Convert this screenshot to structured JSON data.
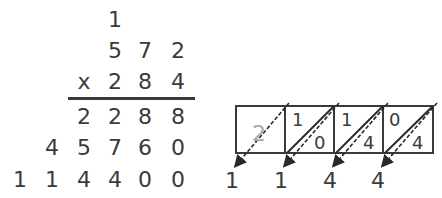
{
  "multiplication": {
    "carry": "1",
    "multiplicand": [
      "5",
      "7",
      "2"
    ],
    "operator": "x",
    "multiplier": [
      "2",
      "8",
      "4"
    ],
    "partial_1": [
      "2",
      "2",
      "8",
      "8"
    ],
    "partial_2": [
      "4",
      "5",
      "7",
      "6",
      "0"
    ],
    "result": [
      "1",
      "1",
      "4",
      "4",
      "0",
      "0"
    ]
  },
  "lattice": {
    "cells": [
      {
        "top": "",
        "bottom": "2",
        "faded": true
      },
      {
        "top": "1",
        "bottom": "0"
      },
      {
        "top": "1",
        "bottom": "4"
      },
      {
        "top": "0",
        "bottom": "4"
      }
    ],
    "output_digits": [
      "1",
      "1",
      "4",
      "4"
    ]
  },
  "colors": {
    "ink": "#3a3a3a",
    "faded": "#a8a8a8"
  }
}
